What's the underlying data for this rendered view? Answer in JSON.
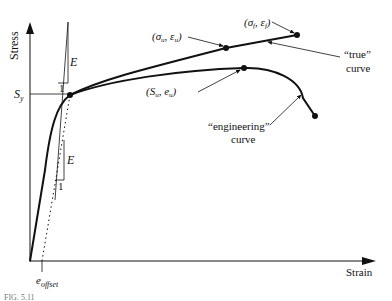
{
  "diagram": {
    "type": "stress-strain curve",
    "axes": {
      "y_label": "Stress",
      "x_label": "Strain"
    },
    "labels": {
      "yield_stress": "S",
      "yield_stress_sub": "y",
      "modulus_top": "E",
      "modulus_top_run": "1",
      "modulus_bottom": "E",
      "modulus_bottom_run": "1",
      "offset": "e",
      "offset_sub": "offset",
      "true_uts": "(σ",
      "true_uts_sub1": "u",
      "true_uts_mid": ", ε",
      "true_uts_sub2": "u",
      "true_uts_end": ")",
      "true_fracture": "(σ",
      "true_fracture_sub1": "f",
      "true_fracture_mid": ", ε",
      "true_fracture_sub2": "f",
      "true_fracture_end": ")",
      "eng_uts": "(S",
      "eng_uts_sub1": "u",
      "eng_uts_mid": ", e",
      "eng_uts_sub2": "u",
      "eng_uts_end": ")",
      "true_curve_line1": "“true”",
      "true_curve_line2": "curve",
      "eng_curve_line1": "“engineering”",
      "eng_curve_line2": "curve"
    },
    "caption_partial": "FIG. 5.11"
  }
}
